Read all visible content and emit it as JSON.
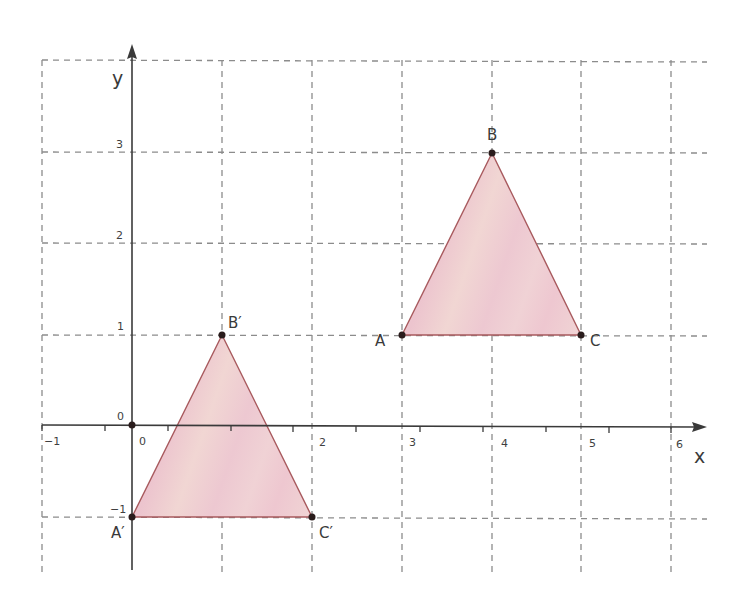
{
  "diagram": {
    "type": "coordinate-plane-translation",
    "axes": {
      "x_label": "x",
      "y_label": "y",
      "origin_label": "0",
      "x_tick_labels": [
        "−1",
        "0",
        "2",
        "3",
        "4",
        "5",
        "6"
      ],
      "y_tick_labels": [
        "−1",
        "1",
        "2",
        "3"
      ],
      "x_range": [
        -1,
        6
      ],
      "y_range": [
        -1,
        3
      ]
    },
    "grid": {
      "style": "dashed",
      "x_lines": [
        -1,
        0,
        1,
        2,
        3,
        4,
        5,
        6
      ],
      "y_lines": [
        -1,
        0,
        1,
        2,
        3,
        4
      ]
    },
    "colors": {
      "fill": "#efcdd3",
      "stroke": "#a85a5e",
      "grid": "#8c8c8c",
      "axis": "#3a3a3a"
    },
    "triangles": [
      {
        "name": "ABC",
        "vertices": [
          {
            "label": "A",
            "x": 3,
            "y": 1
          },
          {
            "label": "B",
            "x": 4,
            "y": 3
          },
          {
            "label": "C",
            "x": 5,
            "y": 1
          }
        ]
      },
      {
        "name": "A'B'C'",
        "vertices": [
          {
            "label": "A′",
            "x": 0,
            "y": -1
          },
          {
            "label": "B′",
            "x": 1,
            "y": 1
          },
          {
            "label": "C′",
            "x": 2,
            "y": -1
          }
        ]
      }
    ]
  }
}
